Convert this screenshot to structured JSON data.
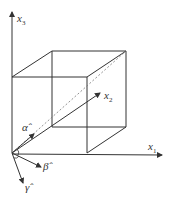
{
  "diagram": {
    "title": "",
    "axes": {
      "x1": {
        "label": "x",
        "subscript": "1"
      },
      "x2": {
        "label": "x",
        "subscript": "2"
      },
      "x3": {
        "label": "x",
        "subscript": "3"
      }
    },
    "vectors": {
      "alpha": {
        "label": "α̂"
      },
      "beta": {
        "label": "β̂"
      },
      "gamma": {
        "label": "γ̂"
      }
    },
    "colors": {
      "line": "#333333",
      "dashed": "#777777",
      "background": "#ffffff"
    }
  }
}
